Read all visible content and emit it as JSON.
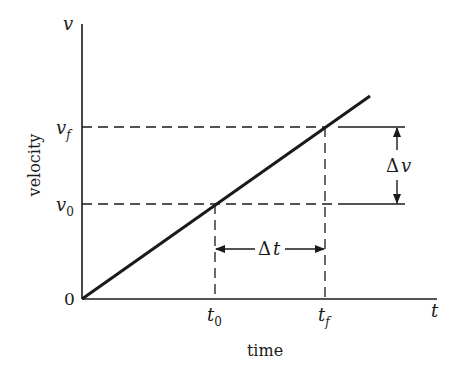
{
  "diagram": {
    "type": "velocity-time graph",
    "axes": {
      "y_symbol": "v",
      "x_symbol": "t",
      "y_label": "velocity",
      "x_label": "time",
      "origin_label": "0"
    },
    "y_ticks": {
      "vf": {
        "base": "v",
        "sub": "f"
      },
      "v0": {
        "base": "v",
        "sub": "0"
      }
    },
    "x_ticks": {
      "t0": {
        "base": "t",
        "sub": "0"
      },
      "tf": {
        "base": "t",
        "sub": "f"
      }
    },
    "annotations": {
      "delta_t": {
        "delta": "Δ",
        "sym": "t"
      },
      "delta_v": {
        "delta": "Δ",
        "sym": "v"
      }
    },
    "colors": {
      "ink": "#1a1a1a",
      "background": "#ffffff"
    }
  }
}
